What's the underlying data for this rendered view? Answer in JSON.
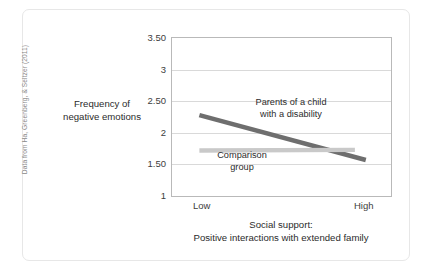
{
  "source_note": "Data from Ha, Greenberg, & Seltzer (2011)",
  "chart_data": {
    "type": "line",
    "title": "",
    "xlabel": "Social support:\nPositive interactions with extended family",
    "xlabel_line1": "Social support:",
    "xlabel_line2": "Positive interactions with extended family",
    "ylabel": "Frequency of negative emotions",
    "ylabel_line1": "Frequency of",
    "ylabel_line2": "negative emotions",
    "categories": [
      "Low",
      "High"
    ],
    "x_tick_labels": [
      "Low",
      "High"
    ],
    "y_tick_labels": [
      "3.50",
      "3",
      "2.50",
      "2",
      "1.50",
      "1"
    ],
    "y_tick_values": [
      3.5,
      3,
      2.5,
      2,
      1.5,
      1
    ],
    "ylim": [
      1,
      3.5
    ],
    "grid": true,
    "legend_position": "inline-annotations",
    "series": [
      {
        "name": "Parents of a child with a disability",
        "label_line1": "Parents of a child",
        "label_line2": "with a disability",
        "values": [
          2.28,
          1.57
        ],
        "color": "#6e6e6e"
      },
      {
        "name": "Comparison group",
        "label_line1": "Comparison",
        "label_line2": "group",
        "values": [
          1.72,
          1.73
        ],
        "color": "#c9c9c9"
      }
    ]
  }
}
